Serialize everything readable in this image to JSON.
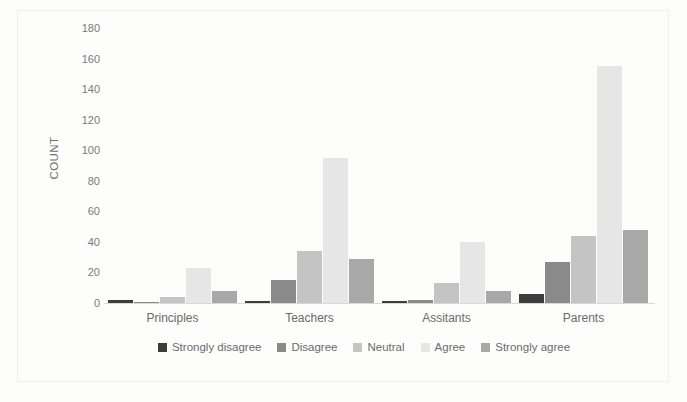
{
  "chart_data": {
    "type": "bar",
    "title": "",
    "xlabel": "",
    "ylabel": "COUNT",
    "ylim": [
      0,
      180
    ],
    "yticks": [
      0,
      20,
      40,
      60,
      80,
      100,
      120,
      140,
      160,
      180
    ],
    "grid": false,
    "legend_position": "bottom",
    "categories": [
      "Principles",
      "Teachers",
      "Assitants",
      "Parents"
    ],
    "series": [
      {
        "name": "Strongly disagree",
        "color": "#3d3d3d",
        "values": [
          2,
          1,
          1,
          6
        ]
      },
      {
        "name": "Disagree",
        "color": "#8a8a8a",
        "values": [
          0,
          15,
          2,
          27
        ]
      },
      {
        "name": "Neutral",
        "color": "#c4c4c4",
        "values": [
          4,
          34,
          13,
          44
        ]
      },
      {
        "name": "Agree",
        "color": "#e6e6e6",
        "values": [
          23,
          95,
          40,
          155
        ]
      },
      {
        "name": "Strongly agree",
        "color": "#a8a8a8",
        "values": [
          8,
          29,
          8,
          48
        ]
      }
    ]
  }
}
